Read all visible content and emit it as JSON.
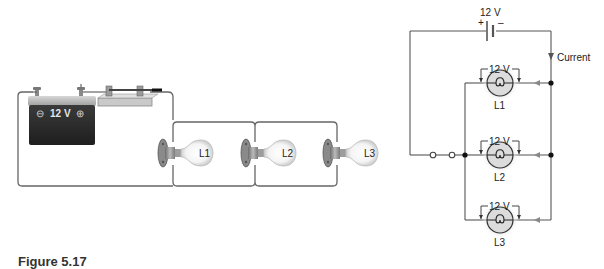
{
  "figure": {
    "caption": "Figure 5.17"
  },
  "pictorial": {
    "battery": {
      "label": "12 V",
      "negative_symbol": "⊖",
      "positive_symbol": "⊕"
    },
    "switch": {
      "state": "closed"
    },
    "lamps": [
      {
        "label": "L1"
      },
      {
        "label": "L2"
      },
      {
        "label": "L3"
      }
    ]
  },
  "schematic": {
    "source": {
      "voltage_label": "12 V",
      "plus": "+",
      "minus": "–"
    },
    "current_label": "Current",
    "lamps": [
      {
        "label": "L1",
        "voltage_label": "12 V"
      },
      {
        "label": "L2",
        "voltage_label": "12 V"
      },
      {
        "label": "L3",
        "voltage_label": "12 V"
      }
    ]
  },
  "colors": {
    "wire": "#555555",
    "battery_body": "#2b2b2b",
    "battery_top": "#bdbdbd",
    "lamp_fill": "#d9d9d9",
    "lamp_glow": "#e8e8e8"
  }
}
